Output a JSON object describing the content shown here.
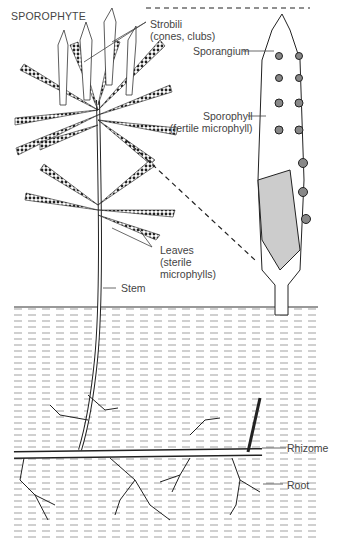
{
  "title": "SPOROPHYTE",
  "labels": {
    "strobili": {
      "line1": "Strobili",
      "line2": "(cones, clubs)"
    },
    "sporangium": "Sporangium",
    "sporophyll": {
      "line1": "Sporophyll",
      "line2": "(fertile microphyll)"
    },
    "leaves": {
      "line1": "Leaves",
      "line2": "(sterile",
      "line3": "microphylls)"
    },
    "stem": "Stem",
    "rhizome": "Rhizome",
    "root": "Root"
  },
  "colors": {
    "ink": "#222222",
    "label": "#444444",
    "background": "#ffffff"
  }
}
